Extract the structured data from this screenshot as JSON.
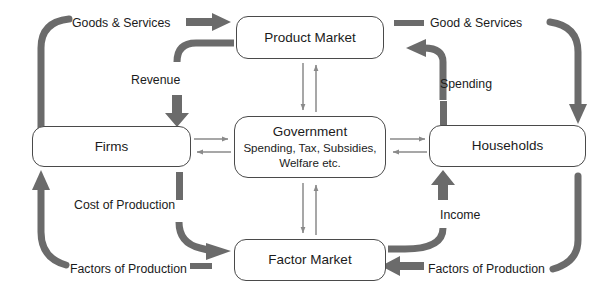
{
  "diagram": {
    "colors": {
      "thick_arrow": "#6b6b6b",
      "thin_arrow": "#8a8a8a",
      "box_border": "#4a4a4a",
      "text": "#1b1b1b",
      "background": "#ffffff"
    },
    "nodes": {
      "product_market": {
        "title": "Product Market"
      },
      "firms": {
        "title": "Firms"
      },
      "government": {
        "title": "Government",
        "line2": "Spending, Tax, Subsidies,",
        "line3": "Welfare etc."
      },
      "households": {
        "title": "Households"
      },
      "factor_market": {
        "title": "Factor Market"
      }
    },
    "flow_labels": {
      "goods_services_left": "Goods & Services",
      "goods_services_right": "Good & Services",
      "revenue": "Revenue",
      "spending": "Spending",
      "cost_of_production": "Cost of Production",
      "income": "Income",
      "factors_of_production_left": "Factors of Production",
      "factors_of_production_right": "Factors of Production"
    },
    "flows": [
      {
        "name": "firms-to-goods-services",
        "from": "Firms",
        "to": "Goods & Services",
        "label": "Goods & Services",
        "style": "thick-curve"
      },
      {
        "name": "goods-services-to-product-market",
        "from": "Goods & Services",
        "to": "Product Market",
        "label": "Goods & Services",
        "style": "thick-arrow"
      },
      {
        "name": "product-market-to-revenue",
        "from": "Product Market",
        "to": "Revenue",
        "label": "Revenue",
        "style": "thick-curve"
      },
      {
        "name": "revenue-to-firms",
        "from": "Revenue",
        "to": "Firms",
        "label": "Revenue",
        "style": "thick-arrow"
      },
      {
        "name": "households-to-goods-services",
        "from": "Households",
        "to": "Good & Services",
        "label": "Good & Services",
        "style": "thick-curve"
      },
      {
        "name": "spending-to-product-market",
        "from": "Spending",
        "to": "Product Market",
        "label": "Spending",
        "style": "thick-arrow"
      },
      {
        "name": "households-to-spending",
        "from": "Households",
        "to": "Spending",
        "label": "Spending",
        "style": "thick-curve"
      },
      {
        "name": "firms-to-cost-of-production",
        "from": "Firms",
        "to": "Cost of Production",
        "label": "Cost of Production",
        "style": "thick-curve"
      },
      {
        "name": "cost-of-production-to-factor-market",
        "from": "Cost of Production",
        "to": "Factor Market",
        "label": "Cost of Production",
        "style": "thick-arrow"
      },
      {
        "name": "factors-of-production-to-firms",
        "from": "Factors of Production",
        "to": "Firms",
        "label": "Factors of Production",
        "style": "thick-arrow"
      },
      {
        "name": "factor-market-to-income",
        "from": "Factor Market",
        "to": "Income",
        "label": "Income",
        "style": "thick-curve"
      },
      {
        "name": "income-to-households",
        "from": "Income",
        "to": "Households",
        "label": "Income",
        "style": "thick-arrow"
      },
      {
        "name": "households-to-factors-of-production",
        "from": "Households",
        "to": "Factors of Production",
        "label": "Factors of Production",
        "style": "thick-curve"
      },
      {
        "name": "factors-of-production-to-factor-market",
        "from": "Factors of Production",
        "to": "Factor Market",
        "label": "Factors of Production",
        "style": "thick-arrow"
      },
      {
        "name": "government-firms-exchange",
        "from": "Government",
        "to": "Firms",
        "label": "",
        "style": "thin-bidirectional"
      },
      {
        "name": "government-households-exchange",
        "from": "Government",
        "to": "Households",
        "label": "",
        "style": "thin-bidirectional"
      },
      {
        "name": "government-product-market-exchange",
        "from": "Government",
        "to": "Product Market",
        "label": "",
        "style": "thin-bidirectional"
      },
      {
        "name": "government-factor-market-exchange",
        "from": "Government",
        "to": "Factor Market",
        "label": "",
        "style": "thin-bidirectional"
      }
    ]
  }
}
